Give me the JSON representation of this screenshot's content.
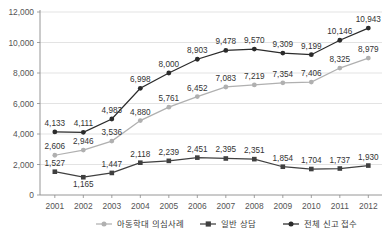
{
  "chart_data": {
    "type": "line",
    "title": "",
    "xlabel": "",
    "ylabel": "",
    "categories": [
      "2001",
      "2002",
      "2003",
      "2004",
      "2005",
      "2006",
      "2007",
      "2008",
      "2009",
      "2010",
      "2011",
      "2012"
    ],
    "ylim": [
      0,
      12000
    ],
    "yticks": [
      "0",
      "2,000",
      "4,000",
      "6,000",
      "8,000",
      "10,000",
      "12,000"
    ],
    "ytick_values": [
      0,
      2000,
      4000,
      6000,
      8000,
      10000,
      12000
    ],
    "grid": true,
    "legend_position": "bottom",
    "series": [
      {
        "name": "아동학대 의심사례",
        "color": "#b0b0b0",
        "marker": "circle",
        "values": [
          2606,
          2946,
          3536,
          4880,
          5761,
          6452,
          7083,
          7219,
          7354,
          7406,
          8325,
          8979
        ],
        "labels": [
          "2,606",
          "2,946",
          "3,536",
          "4,880",
          "5,761",
          "6,452",
          "7,083",
          "7,219",
          "7,354",
          "7,406",
          "8,325",
          "8,979"
        ]
      },
      {
        "name": "일반 상담",
        "color": "#404040",
        "marker": "square",
        "values": [
          1527,
          1165,
          1447,
          2118,
          2239,
          2451,
          2395,
          2351,
          1854,
          1704,
          1737,
          1930
        ],
        "labels": [
          "1,527",
          "1,165",
          "1,447",
          "2,118",
          "2,239",
          "2,451",
          "2,395",
          "2,351",
          "1,854",
          "1,704",
          "1,737",
          "1,930"
        ]
      },
      {
        "name": "전체 신고 접수",
        "color": "#2b2b2b",
        "marker": "circle",
        "values": [
          4133,
          4111,
          4983,
          6998,
          8000,
          8903,
          9478,
          9570,
          9309,
          9199,
          10146,
          10943
        ],
        "labels": [
          "4,133",
          "4,111",
          "4,983",
          "6,998",
          "8,000",
          "8,903",
          "9,478",
          "9,570",
          "9,309",
          "9,199",
          "10,146",
          "10,943"
        ]
      }
    ]
  }
}
